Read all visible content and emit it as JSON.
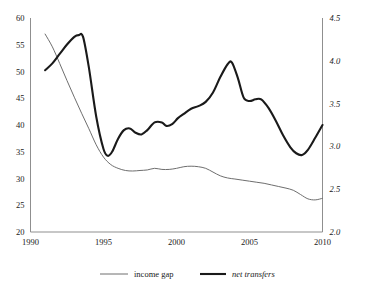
{
  "chart_data": {
    "type": "line",
    "title": "",
    "subtitle": "",
    "xlabel": "",
    "ylabel": "",
    "grid": false,
    "legend_position": "bottom",
    "xlim": [
      1990,
      2010
    ],
    "x_ticks": [
      "1990",
      "1995",
      "2000",
      "2005",
      "2010"
    ],
    "x_tick_values": [
      1990,
      1995,
      2000,
      2005,
      2010
    ],
    "left_axis": {
      "ylim": [
        20,
        60
      ],
      "ticks": [
        "20",
        "25",
        "30",
        "35",
        "40",
        "45",
        "50",
        "55",
        "60"
      ],
      "tick_values": [
        20,
        25,
        30,
        35,
        40,
        45,
        50,
        55,
        60
      ],
      "series": "income gap"
    },
    "right_axis": {
      "ylim": [
        2.0,
        4.5
      ],
      "ticks": [
        "2.0",
        "2.5",
        "3.0",
        "3.5",
        "4.0",
        "4.5"
      ],
      "tick_values": [
        2.0,
        2.5,
        3.0,
        3.5,
        4.0,
        4.5
      ],
      "series": "net transfers",
      "italic": true
    },
    "series": [
      {
        "name": "income gap",
        "axis": "left",
        "color": "#6e6e6e",
        "width": 1,
        "italic_label": false,
        "x": [
          1991.0,
          1991.5,
          1992.0,
          1992.5,
          1993.0,
          1993.5,
          1994.0,
          1994.5,
          1995.0,
          1995.5,
          1996.0,
          1996.5,
          1997.0,
          1997.5,
          1998.0,
          1998.5,
          1999.0,
          1999.5,
          2000.0,
          2000.5,
          2001.0,
          2001.5,
          2002.0,
          2002.5,
          2003.0,
          2003.5,
          2004.0,
          2004.5,
          2005.0,
          2005.5,
          2006.0,
          2006.5,
          2007.0,
          2007.5,
          2008.0,
          2008.5,
          2009.0,
          2009.5,
          2010.0
        ],
        "y": [
          57.0,
          54.6,
          51.5,
          48.3,
          45.2,
          42.2,
          39.3,
          36.3,
          34.0,
          32.6,
          31.9,
          31.5,
          31.4,
          31.5,
          31.6,
          31.9,
          31.7,
          31.7,
          31.9,
          32.2,
          32.3,
          32.2,
          31.9,
          31.2,
          30.5,
          30.1,
          29.9,
          29.7,
          29.5,
          29.3,
          29.1,
          28.8,
          28.5,
          28.2,
          27.8,
          27.0,
          26.2,
          26.0,
          26.3
        ]
      },
      {
        "name": "net transfers",
        "axis": "right",
        "color": "#1a1a1a",
        "width": 2.1,
        "italic_label": true,
        "x": [
          1991.0,
          1991.5,
          1992.0,
          1992.5,
          1993.0,
          1993.3,
          1993.6,
          1994.0,
          1994.5,
          1995.0,
          1995.3,
          1995.6,
          1996.0,
          1996.4,
          1996.8,
          1997.2,
          1997.6,
          1998.0,
          1998.5,
          1999.0,
          1999.3,
          1999.7,
          2000.1,
          2000.5,
          2001.0,
          2001.5,
          2002.0,
          2002.5,
          2003.0,
          2003.5,
          2003.8,
          2004.2,
          2004.6,
          2005.0,
          2005.4,
          2005.8,
          2006.3,
          2006.8,
          2007.3,
          2007.8,
          2008.2,
          2008.6,
          2009.0,
          2009.5,
          2010.0
        ],
        "y": [
          3.89,
          3.97,
          4.08,
          4.19,
          4.28,
          4.3,
          4.28,
          3.92,
          3.35,
          2.97,
          2.89,
          2.94,
          3.09,
          3.19,
          3.21,
          3.16,
          3.14,
          3.19,
          3.28,
          3.28,
          3.24,
          3.26,
          3.33,
          3.38,
          3.44,
          3.47,
          3.52,
          3.63,
          3.81,
          3.96,
          3.98,
          3.8,
          3.57,
          3.53,
          3.55,
          3.55,
          3.45,
          3.3,
          3.13,
          2.99,
          2.92,
          2.9,
          2.96,
          3.1,
          3.25
        ]
      }
    ],
    "legend": [
      {
        "label": "income gap",
        "style": "thin",
        "italic": false
      },
      {
        "label": "net transfers",
        "style": "thick",
        "italic": true
      }
    ]
  }
}
